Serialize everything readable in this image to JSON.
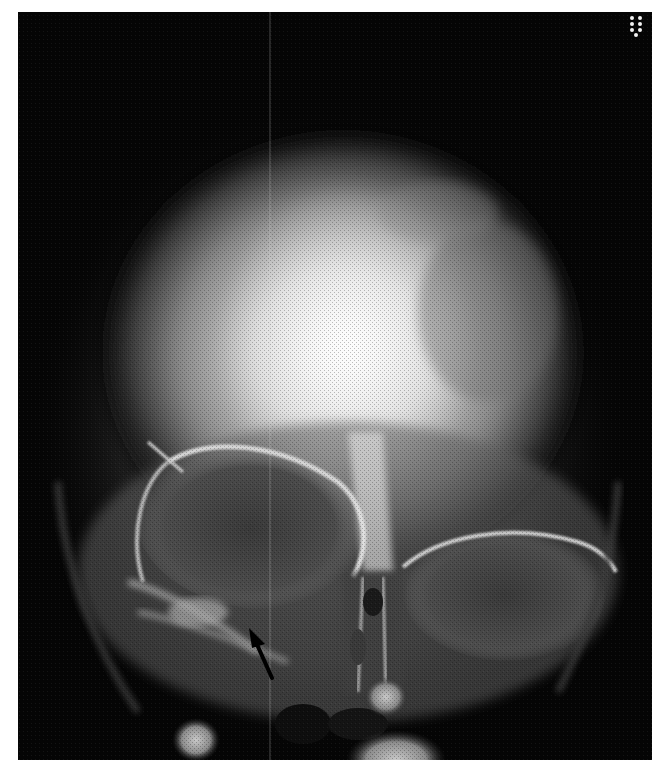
{
  "image": {
    "description": "Frontal (PA/Caldwell-type) skull radiograph showing cranial vault, orbits, nasal cavity and maxillary region",
    "modality": "X-ray",
    "view": "frontal skull",
    "background_color": "#050505",
    "frame_color": "#ffffff",
    "annotations": [
      {
        "type": "arrow",
        "color": "#000000",
        "tip": [
          249,
          628
        ],
        "tail": [
          273,
          680
        ],
        "points_to": "floor of right orbit / infraorbital region"
      }
    ],
    "corner_marker": {
      "type": "dot-pattern",
      "position": "top-right",
      "color": "#f2f2f2",
      "dots": 7
    },
    "artifacts": [
      {
        "type": "vertical-line",
        "x": 270,
        "color": "#d8d8d8"
      }
    ]
  }
}
